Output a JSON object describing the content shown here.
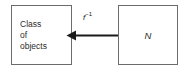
{
  "diagram": {
    "type": "flow-diagram",
    "background_color": "#ffffff",
    "border_color": "#6b6b6b",
    "text_color": "#2b2b2b",
    "edge_color": "#1a1a1a",
    "nodes": [
      {
        "id": "class-of-objects",
        "shape": "rectangle",
        "label_lines": [
          "Class",
          "of",
          "objects"
        ],
        "line1": "Class",
        "line2": "of",
        "line3": "objects",
        "align": "left"
      },
      {
        "id": "n",
        "shape": "rectangle",
        "label": "N",
        "style": "italic",
        "align": "center"
      }
    ],
    "edges": [
      {
        "id": "f-inverse",
        "from": "n",
        "to": "class-of-objects",
        "direction": "left",
        "arrowhead": "solid-triangle",
        "label_base": "f",
        "label_exponent": "−1"
      }
    ]
  }
}
